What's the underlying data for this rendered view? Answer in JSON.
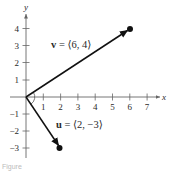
{
  "figure": {
    "axes": {
      "x_label": "x",
      "y_label": "y",
      "x_ticks": [
        "1",
        "2",
        "3",
        "4",
        "5",
        "6",
        "7"
      ],
      "y_ticks_positive": [
        "1",
        "2",
        "3",
        "4"
      ],
      "y_ticks_negative": [
        "−1",
        "−2",
        "−3"
      ]
    },
    "vectors": [
      {
        "name": "v",
        "label_var": "v",
        "label_rest": " = ⟨6, 4⟩",
        "x": 6,
        "y": 4
      },
      {
        "name": "u",
        "label_var": "u",
        "label_rest": " = ⟨2, −3⟩",
        "x": 2,
        "y": -3
      }
    ],
    "caption": "Figure"
  },
  "colors": {
    "ink": "#111111",
    "axis": "#555555",
    "background": "#ffffff"
  }
}
